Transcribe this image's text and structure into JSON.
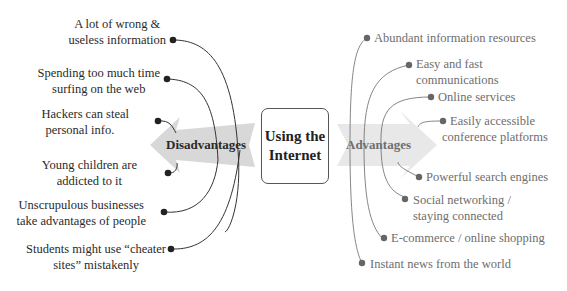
{
  "center": {
    "line1": "Using the",
    "line2": "Internet"
  },
  "disadvantages": {
    "title": "Disadvantages",
    "color": "#2a2a2a",
    "arrow_color": "#d6d6d6",
    "items": [
      {
        "line1": "A lot of wrong &",
        "line2": "useless information"
      },
      {
        "line1": "Spending too much time",
        "line2": "surfing on the web"
      },
      {
        "line1": "Hackers can steal",
        "line2": "personal info."
      },
      {
        "line1": "Young children are",
        "line2": "addicted to it"
      },
      {
        "line1": "Unscrupulous businesses",
        "line2": "take advantages of people"
      },
      {
        "line1": "Students might use “cheater",
        "line2": "sites” mistakenly"
      }
    ]
  },
  "advantages": {
    "title": "Advantages",
    "color": "#6e6e6e",
    "arrow_color": "#e6e6e6",
    "items": [
      {
        "line1": "Abundant information resources",
        "line2": ""
      },
      {
        "line1": "Easy and fast",
        "line2": "communications"
      },
      {
        "line1": "Online services",
        "line2": ""
      },
      {
        "line1": "Easily accessible",
        "line2": "conference platforms"
      },
      {
        "line1": "Powerful search engines",
        "line2": ""
      },
      {
        "line1": "Social networking /",
        "line2": "staying connected"
      },
      {
        "line1": "E-commerce / online shopping",
        "line2": ""
      },
      {
        "line1": "Instant news from the world",
        "line2": ""
      }
    ]
  }
}
